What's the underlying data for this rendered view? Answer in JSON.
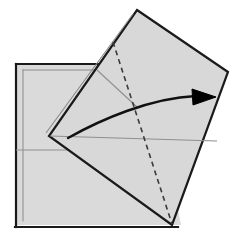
{
  "figure": {
    "canvas": {
      "width": 244,
      "height": 244,
      "background": "#ffffff"
    }
  },
  "style": {
    "paper_fill": "#d8d8d8",
    "paper_fill_back": "#dadada",
    "edge_stroke": "#1a1a1a",
    "edge_stroke_width": 2.2,
    "thickness_stroke": "#8a8a8a",
    "thickness_stroke_width": 1.0,
    "crease_stroke": "#8f8f8f",
    "crease_stroke_width": 1.1,
    "dashed_stroke": "#3a3a3a",
    "dashed_stroke_width": 1.6,
    "dash_pattern": "5,4",
    "arrow_stroke": "#111111",
    "arrow_stroke_width": 2.4,
    "arrow_fill": "#000000"
  },
  "shapes": {
    "back_square": {
      "label": "Back square sheet",
      "points": "16,64 150,64 181,225 16,225",
      "outline_points": "16,64 152,64 181,227 16,227",
      "thickness_offset_points": "21,69 150,69 150,69",
      "edge_top": {
        "x1": 16,
        "y1": 64,
        "x2": 152,
        "y2": 64
      },
      "edge_left": {
        "x1": 16,
        "y1": 64,
        "x2": 16,
        "y2": 227
      },
      "edge_bottom": {
        "x1": 16,
        "y1": 227,
        "x2": 178,
        "y2": 227
      },
      "inner_top": {
        "x1": 22,
        "y1": 70,
        "x2": 150,
        "y2": 70
      },
      "inner_left": {
        "x1": 22,
        "y1": 70,
        "x2": 22,
        "y2": 222
      },
      "horizontal_crease": {
        "x1": 16,
        "y1": 150,
        "x2": 66,
        "y2": 150
      }
    },
    "tilted_flap": {
      "label": "Rotated folded flap",
      "points": "137,10 228,72 172,225 49,136",
      "corner_top": {
        "x": 137,
        "y": 10
      },
      "corner_right": {
        "x": 228,
        "y": 72
      },
      "corner_bottom": {
        "x": 172,
        "y": 225
      },
      "corner_left": {
        "x": 49,
        "y": 136
      },
      "thickness_edge": {
        "x1": 133,
        "y1": 13,
        "x2": 46,
        "y2": 134
      },
      "dashed_fold": {
        "x1": 113,
        "y1": 42,
        "x2": 172,
        "y2": 225
      },
      "diagonal_crease": {
        "x1": 49,
        "y1": 136,
        "x2": 218,
        "y2": 141
      },
      "short_crease": {
        "x1": 97,
        "y1": 70,
        "x2": 134,
        "y2": 104
      }
    },
    "motion_arrow": {
      "label": "Fold direction arrow",
      "path": "M 68,138 C 100,120 150,98 196,96",
      "head_tip": {
        "x": 216,
        "y": 97
      },
      "head_points": "216,97 192,89 193,105"
    }
  },
  "annotations": {
    "fold_type": "valley fold",
    "arrow_direction": "right",
    "arrow_meaning": "rotate flap to the right"
  }
}
